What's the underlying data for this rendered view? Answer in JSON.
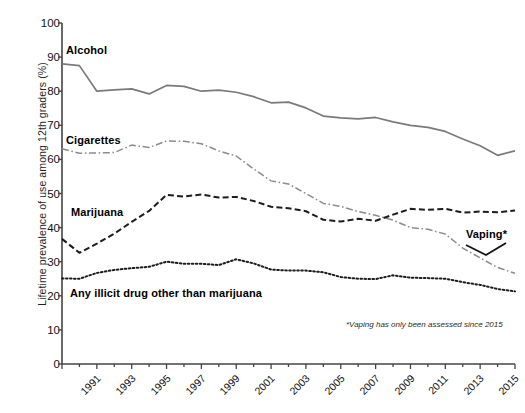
{
  "chart_data": {
    "type": "line",
    "title": "",
    "subtitle": "",
    "xlabel": "",
    "ylabel": "Lifetime prevalence of use among 12th graders (%)",
    "ylim": [
      0,
      100
    ],
    "xlim": [
      1991,
      2017
    ],
    "ytick_labels": [
      "0",
      "10",
      "20",
      "30",
      "40",
      "50",
      "60",
      "70",
      "80",
      "90",
      "100"
    ],
    "ytick_values": [
      0,
      10,
      20,
      30,
      40,
      50,
      60,
      70,
      80,
      90,
      100
    ],
    "xtick_labels": [
      "1991",
      "1993",
      "1995",
      "1997",
      "1999",
      "2001",
      "2003",
      "2005",
      "2007",
      "2009",
      "2011",
      "2013",
      "2015",
      "2017"
    ],
    "xtick_values": [
      1991,
      1993,
      1995,
      1997,
      1999,
      2001,
      2003,
      2005,
      2007,
      2009,
      2011,
      2013,
      2015,
      2017
    ],
    "grid": false,
    "legend_position": "inline-labels",
    "x": [
      1991,
      1992,
      1993,
      1994,
      1995,
      1996,
      1997,
      1998,
      1999,
      2000,
      2001,
      2002,
      2003,
      2004,
      2005,
      2006,
      2007,
      2008,
      2009,
      2010,
      2011,
      2012,
      2013,
      2014,
      2015,
      2016,
      2017
    ],
    "series": [
      {
        "name": "Alcohol",
        "style": "solid",
        "color": "#7a7a7a",
        "values": [
          88.0,
          87.5,
          80.0,
          80.4,
          80.7,
          79.2,
          81.7,
          81.4,
          80.0,
          80.3,
          79.7,
          78.4,
          76.6,
          76.8,
          75.1,
          72.7,
          72.2,
          71.9,
          72.3,
          71.0,
          70.0,
          69.4,
          68.2,
          66.0,
          64.0,
          61.2,
          62.5
        ]
      },
      {
        "name": "Cigarettes",
        "style": "dash-dot",
        "color": "#8c8c8c",
        "values": [
          63.1,
          61.8,
          61.9,
          62.0,
          64.2,
          63.5,
          65.4,
          65.3,
          64.6,
          62.5,
          61.0,
          57.2,
          53.7,
          52.8,
          50.0,
          47.1,
          46.2,
          44.7,
          43.6,
          42.2,
          40.0,
          39.5,
          38.1,
          34.0,
          31.1,
          28.3,
          26.6
        ]
      },
      {
        "name": "Marijuana",
        "style": "dashed",
        "color": "#1c1c1c",
        "values": [
          36.7,
          32.6,
          35.3,
          38.2,
          41.7,
          44.9,
          49.6,
          49.1,
          49.7,
          48.8,
          49.0,
          47.8,
          46.1,
          45.7,
          44.8,
          42.3,
          41.8,
          42.6,
          42.0,
          43.8,
          45.5,
          45.2,
          45.5,
          44.4,
          44.7,
          44.5,
          45.0
        ]
      },
      {
        "name": "Any illicit drug other than marijuana",
        "style": "dotted",
        "color": "#1c1c1c",
        "values": [
          25.1,
          25.0,
          26.7,
          27.6,
          28.1,
          28.5,
          30.0,
          29.4,
          29.4,
          29.0,
          30.7,
          29.5,
          27.7,
          27.4,
          27.4,
          26.9,
          25.5,
          25.0,
          24.9,
          26.0,
          25.3,
          25.2,
          25.0,
          24.0,
          23.2,
          22.0,
          21.3
        ]
      }
    ],
    "annotations": [
      {
        "name": "Vaping",
        "label": "Vaping*",
        "x": 2016,
        "y": 34
      },
      {
        "name": "footnote",
        "label": "*Vaping has only been assessed since 2015"
      }
    ]
  },
  "axis": {
    "ylabel": "Lifetime prevalence of use among 12th graders (%)"
  },
  "labels": {
    "alcohol": "Alcohol",
    "cigarettes": "Cigarettes",
    "marijuana": "Marijuana",
    "illicit": "Any illicit drug other than marijuana",
    "vaping": "Vaping*",
    "footnote": "*Vaping has only been assessed since 2015"
  }
}
